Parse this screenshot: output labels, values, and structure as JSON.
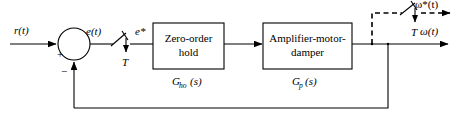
{
  "diagram": {
    "type": "control-block-diagram",
    "background_color": "#ffffff",
    "line_color": "#000000"
  },
  "signals": {
    "input_reference": "r(t)",
    "error": "e(t)",
    "error_sampled": "e*",
    "output_sampled": "ω*(t)",
    "output": "ω(t)"
  },
  "sampler_left": {
    "period_label": "T",
    "style": "solid"
  },
  "sampler_right": {
    "period_label": "T",
    "style": "dashed"
  },
  "summing_junction": {
    "name": "summing-junction",
    "positive_sign": "+",
    "negative_sign": "−"
  },
  "blocks": [
    {
      "id": "zero-order-hold",
      "line1": "Zero-order",
      "line2": "hold",
      "transfer_base": "G",
      "transfer_sub": "ho",
      "transfer_arg": "(s)",
      "transfer_label": "G_ho (s)"
    },
    {
      "id": "amplifier-motor-damper",
      "line1": "Amplifier-motor-",
      "line2": "damper",
      "transfer_base": "G",
      "transfer_sub": "p",
      "transfer_arg": "(s)",
      "transfer_label": "G_p(s)"
    }
  ],
  "feedback": {
    "name": "feedback-path",
    "description": "unity feedback from output node to summing junction"
  }
}
